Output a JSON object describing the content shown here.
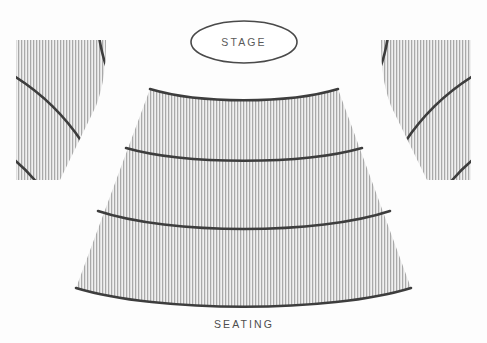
{
  "diagram": {
    "title_visible": false,
    "background_color": "#fdfdfd",
    "stage": {
      "label": "STAGE",
      "shape": "ellipse",
      "outline_color": "#4a4a4a",
      "fill_color": "#ffffff",
      "center_x": 244,
      "center_y": 42,
      "radius_x": 53,
      "radius_y": 21
    },
    "seating": {
      "label": "SEATING",
      "label_x": 244,
      "label_y": 328,
      "hatch_color": "#a8a8a8",
      "hatch_background": "#efefef",
      "divider_color": "#3d3d3d",
      "sections": [
        {
          "name": "center-orchestra",
          "rows": 3,
          "row_dividers": [
            145,
            215
          ]
        },
        {
          "name": "left-wing",
          "rows": 3,
          "row_dividers": [
            70,
            165
          ]
        },
        {
          "name": "right-wing",
          "rows": 3,
          "row_dividers": [
            70,
            165
          ]
        }
      ]
    }
  }
}
